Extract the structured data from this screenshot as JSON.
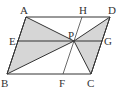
{
  "figure": {
    "type": "parallelogram-diagram",
    "points": {
      "A": "A",
      "B": "B",
      "C": "C",
      "D": "D",
      "E": "E",
      "F": "F",
      "G": "G",
      "H": "H",
      "P": "P"
    },
    "shaded_regions": [
      "triangle ABP",
      "triangle DPC"
    ],
    "segments": [
      "AD",
      "BC",
      "AB",
      "DC",
      "EG",
      "HF",
      "AP",
      "BP",
      "DP",
      "CP"
    ],
    "colors": {
      "shade": "#d6d6d6",
      "line": "#333333"
    }
  }
}
